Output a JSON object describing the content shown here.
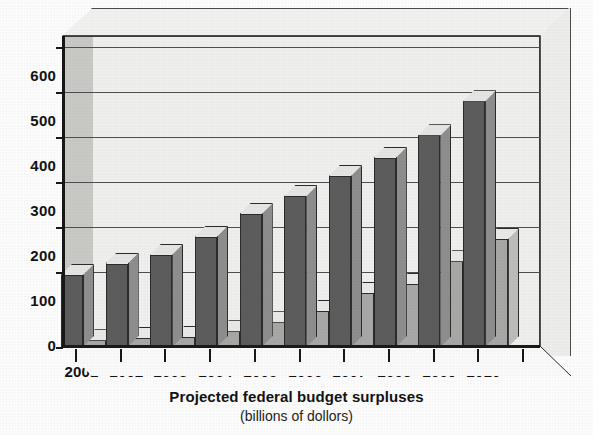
{
  "chart_data": {
    "type": "bar",
    "title": "Projected federal budget surpluses",
    "subtitle": "(billions of dollors)",
    "xlabel": "",
    "ylabel": "",
    "categories": [
      "2001",
      "2002",
      "2003",
      "2004",
      "2005",
      "2006",
      "2007",
      "2008",
      "2009",
      "2010"
    ],
    "series": [
      {
        "name": "total-surplus",
        "color": "#5c5c5c",
        "values": [
          160,
          185,
          205,
          245,
          295,
          335,
          380,
          420,
          470,
          545
        ]
      },
      {
        "name": "on-budget-surplus",
        "color": "#a8a8a6",
        "values": [
          15,
          20,
          22,
          35,
          55,
          80,
          120,
          140,
          190,
          240
        ]
      }
    ],
    "ylim": [
      0,
      690
    ],
    "yticks": [
      0,
      100,
      200,
      300,
      400,
      500,
      600
    ],
    "ytick_labels": [
      "0",
      "100",
      "200",
      "300",
      "400",
      "500",
      "600"
    ],
    "grid": true,
    "legend": "none",
    "style": "3d-bar"
  }
}
